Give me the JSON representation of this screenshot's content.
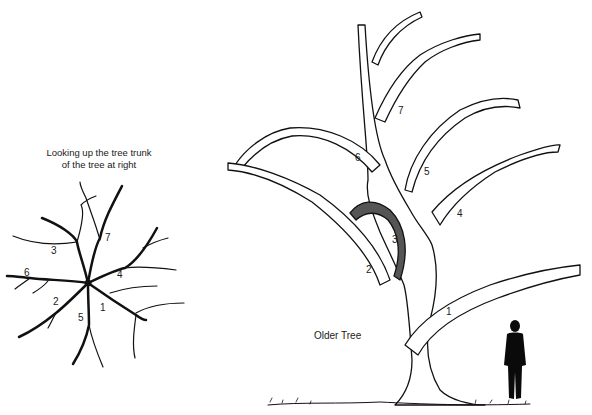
{
  "left_view": {
    "caption_line1": "Looking up the tree trunk",
    "caption_line2": "of the tree at right",
    "branch_numbers": [
      "1",
      "2",
      "3",
      "4",
      "5",
      "6",
      "7"
    ]
  },
  "right_view": {
    "title": "Older Tree",
    "branch_numbers": [
      "1",
      "2",
      "3",
      "4",
      "5",
      "6",
      "7"
    ]
  },
  "colors": {
    "ink": "#111111",
    "background": "#ffffff"
  }
}
